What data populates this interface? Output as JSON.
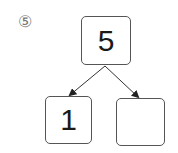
{
  "problem_label": "⑤",
  "diagram": {
    "top": {
      "value": "5"
    },
    "left": {
      "value": "1"
    },
    "right": {
      "value": ""
    }
  }
}
